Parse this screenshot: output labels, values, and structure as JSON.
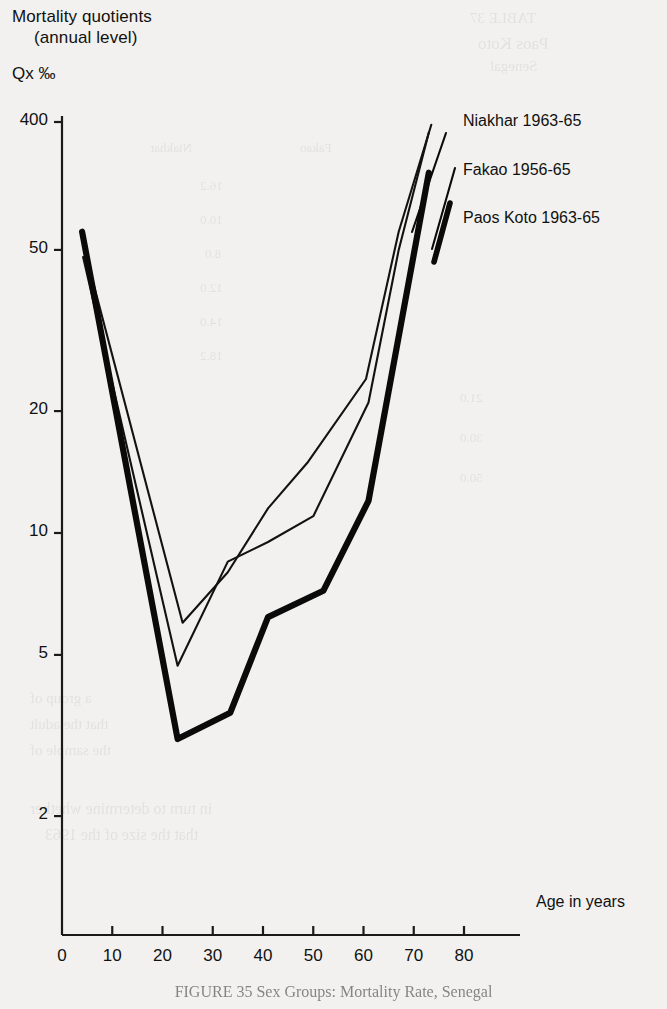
{
  "figure": {
    "title_line1": "Mortality quotients",
    "title_line2": "(annual level)",
    "unit_prefix": "Qx",
    "unit_symbol": "°/oo",
    "caption": "FIGURE 35 Sex Groups: Mortality Rate, Senegal"
  },
  "axes": {
    "x_label": "Age in years",
    "x_ticks": [
      "0",
      "10",
      "20",
      "30",
      "40",
      "50",
      "60",
      "70",
      "80"
    ],
    "y_ticks": [
      "400",
      "50",
      "20",
      "10",
      "5",
      "2"
    ]
  },
  "legend": {
    "entries": [
      {
        "label": "Niakhar 1963-65"
      },
      {
        "label": "Fakao 1956-65"
      },
      {
        "label": "Paos Koto 1963-65"
      }
    ]
  },
  "chart_data": {
    "type": "line",
    "title": "Mortality quotients (annual level)",
    "xlabel": "Age in years",
    "ylabel": "Qx °/oo",
    "y_scale": "log",
    "y_axis_note": "broken axis between 50 and 400",
    "xlim": [
      0,
      80
    ],
    "ylim": [
      1.8,
      400
    ],
    "grid": false,
    "legend_position": "top-right",
    "x_ticks": [
      0,
      10,
      20,
      30,
      40,
      50,
      60,
      70,
      80
    ],
    "y_ticks": [
      2,
      5,
      10,
      20,
      50,
      400
    ],
    "series": [
      {
        "name": "Niakhar 1963-65",
        "style": "thin",
        "color": "#121212",
        "points": [
          {
            "x": 4.5,
            "y": 50.0
          },
          {
            "x": 24.0,
            "y": 6.0
          },
          {
            "x": 33.0,
            "y": 8.0
          },
          {
            "x": 41.0,
            "y": 11.5
          },
          {
            "x": 49.0,
            "y": 15.0
          },
          {
            "x": 60.5,
            "y": 24.0
          },
          {
            "x": 67.0,
            "y": 55.0
          },
          {
            "x": 73.5,
            "y": 380.0
          }
        ]
      },
      {
        "name": "Fakao 1956-65",
        "style": "thin",
        "color": "#121212",
        "points": [
          {
            "x": 4.2,
            "y": 48.0
          },
          {
            "x": 23.0,
            "y": 4.7
          },
          {
            "x": 33.0,
            "y": 8.5
          },
          {
            "x": 41.0,
            "y": 9.5
          },
          {
            "x": 50.0,
            "y": 11.0
          },
          {
            "x": 61.0,
            "y": 21.0
          },
          {
            "x": 67.0,
            "y": 50.0
          },
          {
            "x": 73.0,
            "y": 330.0
          }
        ]
      },
      {
        "name": "Paos Koto 1963-65",
        "style": "thick",
        "color": "#0a0a0a",
        "points": [
          {
            "x": 4.0,
            "y": 55.0
          },
          {
            "x": 23.0,
            "y": 3.1
          },
          {
            "x": 33.5,
            "y": 3.6
          },
          {
            "x": 41.0,
            "y": 6.2
          },
          {
            "x": 52.0,
            "y": 7.2
          },
          {
            "x": 61.0,
            "y": 12.0
          },
          {
            "x": 73.0,
            "y": 160.0
          }
        ]
      }
    ]
  },
  "ghost_text": {
    "lines": [
      {
        "text": "TABLE 37",
        "x": 470,
        "y": 10,
        "size": 15
      },
      {
        "text": "Paos Koto",
        "x": 478,
        "y": 34,
        "size": 17
      },
      {
        "text": "Senegal",
        "x": 490,
        "y": 58,
        "size": 15
      },
      {
        "text": "Niakhar",
        "x": 150,
        "y": 140,
        "size": 13
      },
      {
        "text": "Fakao",
        "x": 300,
        "y": 140,
        "size": 13
      },
      {
        "text": "16.2",
        "x": 200,
        "y": 178,
        "size": 13
      },
      {
        "text": "10.0",
        "x": 200,
        "y": 212,
        "size": 13
      },
      {
        "text": "8.0",
        "x": 205,
        "y": 246,
        "size": 13
      },
      {
        "text": "12.0",
        "x": 200,
        "y": 280,
        "size": 13
      },
      {
        "text": "14.0",
        "x": 200,
        "y": 314,
        "size": 13
      },
      {
        "text": "18.2",
        "x": 200,
        "y": 348,
        "size": 13
      },
      {
        "text": "21.0",
        "x": 460,
        "y": 390,
        "size": 13
      },
      {
        "text": "30.0",
        "x": 460,
        "y": 430,
        "size": 13
      },
      {
        "text": "50.0",
        "x": 460,
        "y": 470,
        "size": 13
      },
      {
        "text": "a group of",
        "x": 30,
        "y": 690,
        "size": 15
      },
      {
        "text": "that the adult",
        "x": 30,
        "y": 716,
        "size": 15
      },
      {
        "text": "the sample of",
        "x": 30,
        "y": 742,
        "size": 15
      },
      {
        "text": "in turn to determine whether",
        "x": 30,
        "y": 800,
        "size": 16
      },
      {
        "text": "that the size of the 1963",
        "x": 45,
        "y": 826,
        "size": 16
      }
    ]
  }
}
